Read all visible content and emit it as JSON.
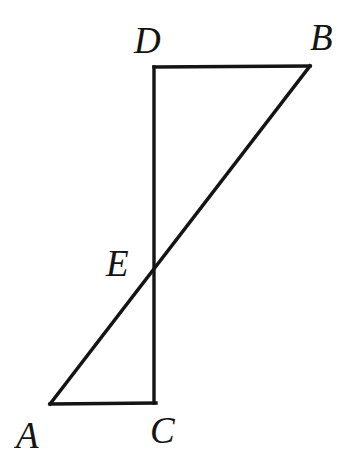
{
  "figure": {
    "kind": "geometry-diagram",
    "width": 352,
    "height": 473,
    "background_color": "#ffffff",
    "stroke_color": "#141414",
    "stroke_width": 3.4,
    "label_color": "#141414",
    "points": {
      "A": {
        "name": "A",
        "x": 50,
        "y": 404
      },
      "B": {
        "name": "B",
        "x": 310,
        "y": 66
      },
      "C": {
        "name": "C",
        "x": 156,
        "y": 403
      },
      "D": {
        "name": "D",
        "x": 154,
        "y": 67
      },
      "E": {
        "name": "E",
        "x": 154,
        "y": 265
      }
    },
    "segments": [
      {
        "id": "DB",
        "name": "segment-DB",
        "from": "D",
        "to": "B",
        "x1": 154,
        "y1": 67,
        "x2": 310,
        "y2": 66
      },
      {
        "id": "DC",
        "name": "segment-DC",
        "from": "D",
        "to": "C",
        "x1": 154,
        "y1": 67,
        "x2": 154,
        "y2": 403
      },
      {
        "id": "AC",
        "name": "segment-AC",
        "from": "A",
        "to": "C",
        "x1": 50,
        "y1": 404,
        "x2": 156,
        "y2": 403
      },
      {
        "id": "AB",
        "name": "segment-AB",
        "from": "A",
        "to": "B",
        "x1": 50,
        "y1": 404,
        "x2": 310,
        "y2": 66
      }
    ],
    "labels": {
      "A": "A",
      "B": "B",
      "C": "C",
      "D": "D",
      "E": "E"
    }
  }
}
